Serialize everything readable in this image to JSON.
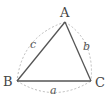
{
  "diagram": {
    "type": "triangle",
    "vertices": [
      {
        "label": "A",
        "x": 65,
        "y": 22
      },
      {
        "label": "B",
        "x": 17,
        "y": 81
      },
      {
        "label": "C",
        "x": 91,
        "y": 81
      }
    ],
    "sides": [
      {
        "label": "a",
        "from": "B",
        "to": "C"
      },
      {
        "label": "b",
        "from": "C",
        "to": "A"
      },
      {
        "label": "c",
        "from": "A",
        "to": "B"
      }
    ],
    "colors": {
      "edge": "#555555",
      "arc": "#bbbbbb",
      "text": "#444444"
    }
  }
}
